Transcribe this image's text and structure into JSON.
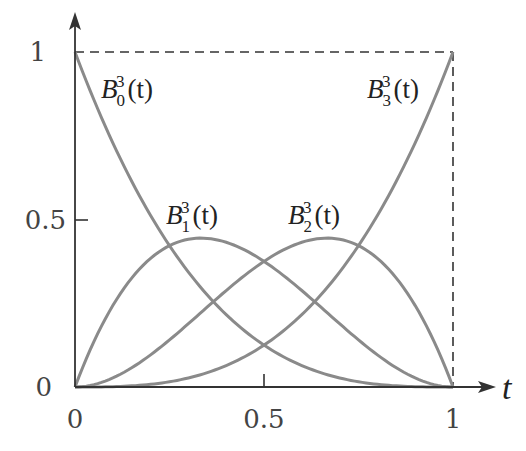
{
  "chart_data": {
    "type": "line",
    "title": "",
    "xlabel": "t",
    "ylabel": "",
    "xlim": [
      0,
      1
    ],
    "ylim": [
      0,
      1
    ],
    "x_ticks": [
      "0",
      "0.5",
      "1"
    ],
    "y_ticks": [
      "0",
      "0.5",
      "1"
    ],
    "grid": false,
    "legend": "inline labels near curves",
    "bounding_box": "dashed lines at y=1 and x=1",
    "x": [
      0,
      0.1,
      0.2,
      0.3,
      0.4,
      0.5,
      0.6,
      0.7,
      0.8,
      0.9,
      1.0
    ],
    "series": [
      {
        "name": "B_0^3(t)",
        "formula": "(1-t)^3",
        "values": [
          1.0,
          0.729,
          0.512,
          0.343,
          0.216,
          0.125,
          0.064,
          0.027,
          0.008,
          0.001,
          0.0
        ]
      },
      {
        "name": "B_1^3(t)",
        "formula": "3t(1-t)^2",
        "values": [
          0.0,
          0.243,
          0.384,
          0.441,
          0.432,
          0.375,
          0.288,
          0.189,
          0.096,
          0.027,
          0.0
        ]
      },
      {
        "name": "B_2^3(t)",
        "formula": "3t^2(1-t)",
        "values": [
          0.0,
          0.027,
          0.096,
          0.189,
          0.288,
          0.375,
          0.432,
          0.441,
          0.384,
          0.243,
          0.0
        ]
      },
      {
        "name": "B_3^3(t)",
        "formula": "t^3",
        "values": [
          0.0,
          0.001,
          0.008,
          0.027,
          0.064,
          0.125,
          0.216,
          0.343,
          0.512,
          0.729,
          1.0
        ]
      }
    ]
  },
  "axes": {
    "x_var": "t",
    "x_tick_labels": [
      "0",
      "0.5",
      "1"
    ],
    "y_tick_labels": [
      "0",
      "0.5",
      "1"
    ]
  },
  "labels": [
    {
      "base": "B",
      "sub": "0",
      "sup": "3",
      "arg": "(t)"
    },
    {
      "base": "B",
      "sub": "1",
      "sup": "3",
      "arg": "(t)"
    },
    {
      "base": "B",
      "sub": "2",
      "sup": "3",
      "arg": "(t)"
    },
    {
      "base": "B",
      "sub": "3",
      "sup": "3",
      "arg": "(t)"
    }
  ],
  "colors": {
    "curve": "#8a8a8a",
    "axis": "#333333",
    "text": "#222222"
  }
}
